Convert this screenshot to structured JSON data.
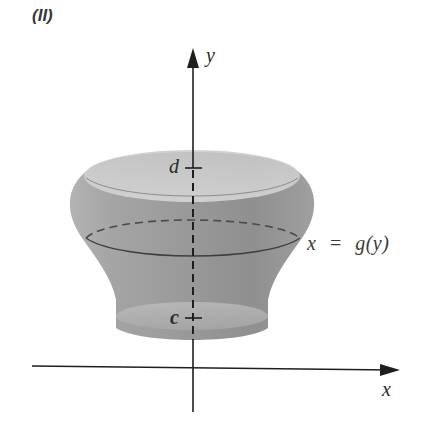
{
  "figure": {
    "panel_label": "(II)",
    "axes": {
      "x_label": "x",
      "y_label": "y"
    },
    "tick_labels": {
      "upper": "d",
      "lower": "c"
    },
    "curve_label": {
      "lhs": "x",
      "equals": "=",
      "rhs": "g(y)"
    },
    "colors": {
      "background": "#ffffff",
      "surface_light": "#d4d4d4",
      "surface_mid": "#a9a9a9",
      "surface_dark": "#8a8a8a",
      "axis": "#1e1e1e",
      "text": "#2b2b2b"
    }
  }
}
